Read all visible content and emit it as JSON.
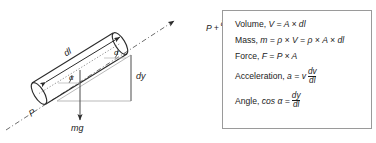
{
  "figure": {
    "type": "physics-free-body-diagram",
    "title": "",
    "diagram": {
      "name": "inclined-fluid-element",
      "description": "Cylindrical fluid element on an incline with forces and geometry",
      "labels": {
        "length_arrow": "dl",
        "pressure_upstream": "P",
        "pressure_downstream_prefix": "P +",
        "pressure_downstream_num": "∂P",
        "pressure_downstream_den": "∂l",
        "pressure_downstream_suffix": "dl",
        "height_arrow": "dy",
        "weight": "mg",
        "angle_lower": "α",
        "angle_upper": "α"
      }
    },
    "formula_box": {
      "name": "derived-quantities-box",
      "border_color": "#9a9a9a",
      "background": "#ffffff",
      "rows": [
        {
          "id": "volume",
          "label": "Volume,",
          "expr": "V = A × dl",
          "fraction": null
        },
        {
          "id": "mass",
          "label": "Mass,",
          "expr": "m = ρ × V = ρ × A × dl",
          "fraction": null
        },
        {
          "id": "force",
          "label": "Force,",
          "expr": "F = P × A",
          "fraction": null
        },
        {
          "id": "acceleration",
          "label": "Acceleration,",
          "expr": "a = v",
          "fraction": {
            "num": "dv",
            "den": "dl"
          }
        },
        {
          "id": "angle",
          "label": "Angle,",
          "expr": "cos α =",
          "fraction": {
            "num": "dy",
            "den": "dl"
          }
        }
      ]
    }
  }
}
